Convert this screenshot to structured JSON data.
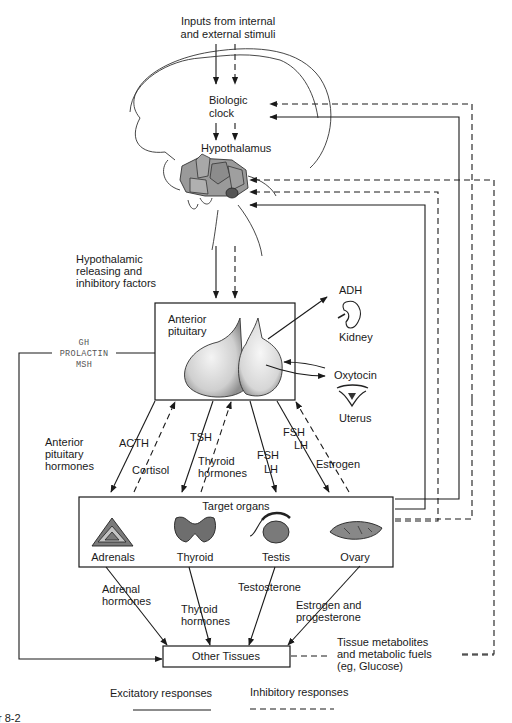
{
  "labels": {
    "inputs_line1": "Inputs from internal",
    "inputs_line2": "and external stimuli",
    "biologic_clock_1": "Biologic",
    "biologic_clock_2": "clock",
    "hypothalamus": "Hypothalamus",
    "releasing_1": "Hypothalamic",
    "releasing_2": "releasing and",
    "releasing_3": "inhibitory factors",
    "anterior_pituitary_1": "Anterior",
    "anterior_pituitary_2": "pituitary",
    "adh": "ADH",
    "kidney": "Kidney",
    "oxytocin": "Oxytocin",
    "uterus": "Uterus",
    "gh": "GH",
    "prolactin": "PROLACTIN",
    "msh": "MSH",
    "ant_pit_hormones_1": "Anterior",
    "ant_pit_hormones_2": "pituitary",
    "ant_pit_hormones_3": "hormones",
    "acth": "ACTH",
    "cortisol": "Cortisol",
    "tsh": "TSH",
    "thyroid_hormones_1": "Thyroid",
    "thyroid_hormones_2": "hormones",
    "fsh_mid": "FSH",
    "lh_mid": "LH",
    "fsh_right": "FSH",
    "lh_right": "LH",
    "estrogen": "Estrogen",
    "target_organs": "Target organs",
    "adrenals": "Adrenals",
    "thyroid": "Thyroid",
    "testis": "Testis",
    "ovary": "Ovary",
    "adrenal_hormones_1": "Adrenal",
    "adrenal_hormones_2": "hormones",
    "thyroid_out_1": "Thyroid",
    "thyroid_out_2": "hormones",
    "testosterone": "Testosterone",
    "estrogen_prog_1": "Estrogen and",
    "estrogen_prog_2": "progesterone",
    "other_tissues": "Other Tissues",
    "metabolites_1": "Tissue metabolites",
    "metabolites_2": "and metabolic fuels",
    "metabolites_3": "(eg, Glucose)",
    "figure_caption_fragment": "r 8-2"
  },
  "legend": {
    "excitatory": "Excitatory responses",
    "inhibitory": "Inhibitory responses"
  },
  "colors": {
    "line": "#1a1a1a",
    "hypothalamus_fill": "#9a9a9a",
    "organ_fill": "#6e6e6e",
    "mono_text": "#555555"
  }
}
